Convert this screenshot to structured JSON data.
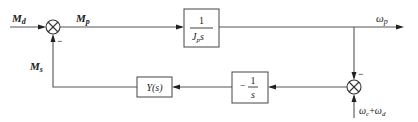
{
  "diagram": {
    "type": "control-block-diagram",
    "signals": {
      "input_torque": {
        "main": "M",
        "sub": "d"
      },
      "sum_output": {
        "main": "M",
        "sub": "p"
      },
      "feedback_torque": {
        "main": "M",
        "sub": "s"
      },
      "output_speed": {
        "main": "ω",
        "sub": "p"
      },
      "reference_speed": {
        "a_main": "ω",
        "a_sub": "c",
        "plus": "+",
        "b_main": "ω",
        "b_sub": "d"
      }
    },
    "blocks": {
      "plant": {
        "numerator": "1",
        "den_main": "J",
        "den_sub": "p",
        "den_var": "s"
      },
      "integrator": {
        "sign": "−",
        "numerator": "1",
        "denominator": "s"
      },
      "controller": {
        "label": "Y(s)"
      }
    },
    "summing_junctions": {
      "sum1": {
        "inputs": [
          "M_d (+)",
          "M_s (−)"
        ],
        "minus_sign": "−"
      },
      "sum2": {
        "inputs": [
          "ω_p (−)",
          "ω_c+ω_d (+)"
        ],
        "minus_sign": "−"
      }
    },
    "colors": {
      "line": "#555555",
      "text": "#222222",
      "background": "#ffffff"
    }
  }
}
